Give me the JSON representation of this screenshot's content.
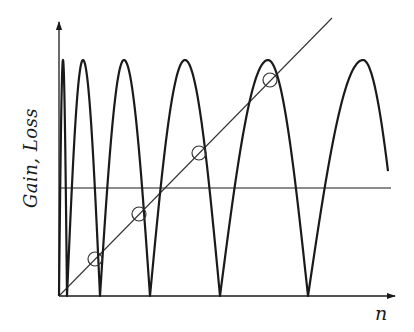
{
  "diagram": {
    "type": "gain-loss oscillation diagram",
    "ylabel": "Gain,  Loss",
    "xlabel": "n",
    "colors": {
      "stroke": "#1a1a1a",
      "thin_stroke": "#333333",
      "background": "#ffffff"
    },
    "axes": {
      "origin": [
        59,
        296
      ],
      "y_axis_top": 22,
      "x_axis_right": 395
    },
    "gain_curve": {
      "description": "Oscillating gain curve; arches reaching a common maximum with period increasing in n",
      "peak_y": 60,
      "base_y": 296,
      "arches": [
        {
          "start_x": 59,
          "peak_x": 63,
          "end_x": 67
        },
        {
          "start_x": 67,
          "peak_x": 83,
          "end_x": 100
        },
        {
          "start_x": 100,
          "peak_x": 124,
          "end_x": 150
        },
        {
          "start_x": 150,
          "peak_x": 185,
          "end_x": 220
        },
        {
          "start_x": 220,
          "peak_x": 268,
          "end_x": 308
        },
        {
          "start_x": 308,
          "peak_x": 363,
          "end_x": 388,
          "end_y": 188
        }
      ]
    },
    "loss_line": {
      "description": "Linear loss line rising with n",
      "from": [
        59,
        296
      ],
      "to": [
        332,
        18
      ]
    },
    "reference_line": {
      "description": "Horizontal level line",
      "y": 188,
      "x_from": 59,
      "x_to": 391
    },
    "intersection_markers": [
      {
        "x": 95,
        "y": 259,
        "r": 7
      },
      {
        "x": 139,
        "y": 214,
        "r": 7
      },
      {
        "x": 199,
        "y": 153,
        "r": 7
      },
      {
        "x": 270,
        "y": 80,
        "r": 7
      }
    ]
  }
}
